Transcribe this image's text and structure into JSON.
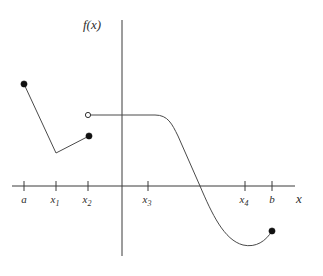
{
  "figure": {
    "title": "",
    "axis_labels": {
      "y": "f(x)",
      "x": "x"
    },
    "tick_labels": [
      {
        "base": "a",
        "sub": ""
      },
      {
        "base": "x",
        "sub": "1"
      },
      {
        "base": "x",
        "sub": "2"
      },
      {
        "base": "x",
        "sub": "3"
      },
      {
        "base": "x",
        "sub": "4"
      },
      {
        "base": "b",
        "sub": ""
      }
    ],
    "colors": {
      "axis": "#3a3a3a",
      "curve": "#4a4a4a",
      "filled_point": "#111111",
      "open_point_fill": "#ffffff",
      "open_point_stroke": "#333333",
      "background": "#ffffff",
      "text": "#2e2e2e"
    }
  },
  "chart_data": {
    "type": "line",
    "title": "",
    "xlabel": "x",
    "ylabel": "f(x)",
    "grid": false,
    "legend": "none",
    "axis": {
      "x_axis_pixel_y": 186,
      "y_axis_pixel_x": 122,
      "x_axis_pixel_range": [
        12,
        295
      ],
      "y_axis_pixel_range": [
        20,
        256
      ]
    },
    "tick_positions_px": [
      24,
      56,
      88,
      148,
      245,
      272
    ],
    "tick_names": [
      "a",
      "x_1",
      "x_2",
      "x_3",
      "x_4",
      "b"
    ],
    "segments": [
      {
        "name": "left-descending-segment",
        "kind": "polyline",
        "points_px": [
          [
            24,
            84
          ],
          [
            56,
            153
          ],
          [
            89,
            136
          ]
        ],
        "note": "Straight line from closed endpoint at a down to a corner at x1 then up to closed point just left of x2"
      },
      {
        "name": "plateau-segment",
        "kind": "path",
        "d": "M 88 115 L 155 115 C 168 115 172 124 178 136 L 200 186",
        "note": "Horizontal constant branch starting at open circle at x2, flat across the y-axis, then curving downward"
      },
      {
        "name": "descending-to-minimum",
        "kind": "path",
        "d": "M 200 186 C 212 214 224 240 243 245 C 256 248 266 241 272 231",
        "note": "Continues falling past the x-axis crossing to a local minimum then rises to the closed endpoint at b"
      }
    ],
    "points": [
      {
        "name": "endpoint-at-a",
        "x_px": 24,
        "y_px": 84,
        "style": "filled"
      },
      {
        "name": "corner-at-x1",
        "x_px": 56,
        "y_px": 153,
        "style": "none"
      },
      {
        "name": "endpoint-left-of-x2",
        "x_px": 89,
        "y_px": 136,
        "style": "filled"
      },
      {
        "name": "removable-hole-at-x2",
        "x_px": 88,
        "y_px": 115,
        "style": "open"
      },
      {
        "name": "endpoint-at-b",
        "x_px": 272,
        "y_px": 231,
        "style": "filled"
      }
    ]
  }
}
